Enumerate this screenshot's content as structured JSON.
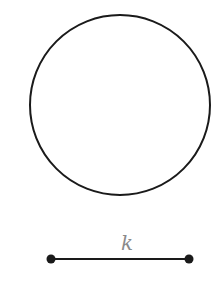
{
  "diagram": {
    "circle": {
      "cx": 120,
      "cy": 105,
      "r": 90,
      "stroke": "#1a1a1a",
      "stroke_width": 2
    },
    "segment": {
      "x1": 51,
      "y1": 259,
      "x2": 189,
      "y2": 259,
      "stroke": "#1a1a1a",
      "stroke_width": 2,
      "endpoint_radius": 4.5
    },
    "segment_label": {
      "text": "k",
      "x": 127,
      "y": 250,
      "color": "#8a8a8a"
    }
  }
}
